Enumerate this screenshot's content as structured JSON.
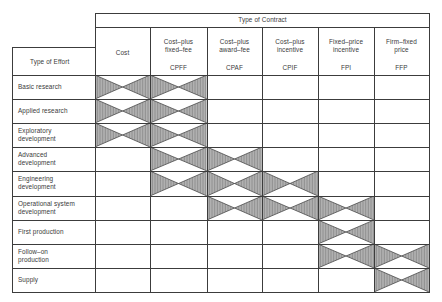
{
  "header": {
    "group_title": "Type of Contract",
    "row_header": "Type of Effort"
  },
  "columns": [
    {
      "label_line1": "Cost",
      "label_line2": "",
      "abbr": ""
    },
    {
      "label_line1": "Cost–plus",
      "label_line2": "fixed–fee",
      "abbr": "CPFF"
    },
    {
      "label_line1": "Cost–plus",
      "label_line2": "award–fee",
      "abbr": "CPAF"
    },
    {
      "label_line1": "Cost–plus",
      "label_line2": "incentive",
      "abbr": "CPIF"
    },
    {
      "label_line1": "Fixed–price",
      "label_line2": "incentive",
      "abbr": "FPI"
    },
    {
      "label_line1": "Firm–fixed",
      "label_line2": "price",
      "abbr": "FFP"
    }
  ],
  "rows": [
    {
      "label_line1": "Basic research",
      "label_line2": "",
      "applicable": [
        0,
        1
      ]
    },
    {
      "label_line1": "Applied research",
      "label_line2": "",
      "applicable": [
        0,
        1
      ]
    },
    {
      "label_line1": "Exploratory",
      "label_line2": "development",
      "applicable": [
        0,
        1
      ]
    },
    {
      "label_line1": "Advanced",
      "label_line2": "development",
      "applicable": [
        1,
        2
      ]
    },
    {
      "label_line1": "Engineering",
      "label_line2": "development",
      "applicable": [
        1,
        2,
        3
      ]
    },
    {
      "label_line1": "Operational system",
      "label_line2": "development",
      "applicable": [
        2,
        3,
        4
      ]
    },
    {
      "label_line1": "First production",
      "label_line2": "",
      "applicable": [
        4
      ]
    },
    {
      "label_line1": "Follow–on",
      "label_line2": "production",
      "applicable": [
        4,
        5
      ]
    },
    {
      "label_line1": "Supply",
      "label_line2": "",
      "applicable": [
        5
      ]
    }
  ],
  "colors": {
    "line": "#3c3c3c",
    "hatch_fill": "#c8c8c8",
    "hatch_stroke": "#4a4a4a",
    "text": "#3a3a3a"
  }
}
